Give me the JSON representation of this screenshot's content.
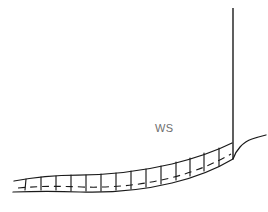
{
  "figure": {
    "background_color": "#ffffff",
    "stroke_color": "#1a1a1a",
    "width": 268,
    "height": 212,
    "type": "line-diagram",
    "labels": [
      {
        "id": "ws",
        "text": "WS",
        "x": 155,
        "y": 132,
        "color": "#6e6e6e",
        "font_size": 11
      }
    ],
    "elements": {
      "vertical_line": {
        "name": "vertical-post",
        "x": 233,
        "y_top": 8,
        "y_bottom": 159,
        "path": "M 233 8 L 233 159"
      },
      "flare_curve": {
        "name": "upsweep-curve",
        "path": "M 233 159 C 236 150 243 142 252 139 C 258 137 262 136 266 135"
      },
      "upper_rail": {
        "name": "upper-rail-curve",
        "path": "M 14 181 C 34 177 55 175 78 175 C 110 175 142 171 172 164 C 196 158 216 151 232 143"
      },
      "lower_rail": {
        "name": "lower-rail-curve",
        "path": "M 13 192 C 36 191 58 191 80 192 C 112 193 143 190 172 183 C 197 177 218 168 233 159"
      },
      "dashed_rail": {
        "name": "dashed-center-rail",
        "path": "M 18 188 C 40 186 60 186 82 187 C 112 188 142 185 170 178 C 195 172 215 163 231 154"
      },
      "rungs": {
        "name": "ladder-rungs",
        "count": 14,
        "segments": [
          "M 26 179 L 25 190",
          "M 41 177 L 41 190",
          "M 56 176 L 56 190",
          "M 71 175 L 71 191",
          "M 86 175 L 86 191",
          "M 101 174 L 101 191",
          "M 116 173 L 116 190",
          "M 131 171 L 131 189",
          "M 146 169 L 146 187",
          "M 161 166 L 161 184",
          "M 176 162 L 176 180",
          "M 190 158 L 190 176",
          "M 204 153 L 204 171",
          "M 219 148 L 219 166"
        ]
      }
    }
  }
}
